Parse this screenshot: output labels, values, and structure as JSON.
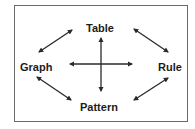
{
  "diagram": {
    "type": "relationship-diagram",
    "nodes": [
      {
        "id": "table",
        "label": "Table",
        "position": "top"
      },
      {
        "id": "graph",
        "label": "Graph",
        "position": "left"
      },
      {
        "id": "rule",
        "label": "Rule",
        "position": "right"
      },
      {
        "id": "pattern",
        "label": "Pattern",
        "position": "bottom"
      }
    ],
    "edges": [
      {
        "from": "graph",
        "to": "table",
        "style": "double-arrow"
      },
      {
        "from": "table",
        "to": "rule",
        "style": "double-arrow"
      },
      {
        "from": "graph",
        "to": "pattern",
        "style": "double-arrow"
      },
      {
        "from": "pattern",
        "to": "rule",
        "style": "double-arrow"
      },
      {
        "from": "graph",
        "to": "rule",
        "style": "double-arrow"
      },
      {
        "from": "table",
        "to": "pattern",
        "style": "double-arrow"
      }
    ],
    "colors": {
      "border": "#6a6a6a",
      "arrow": "#2a2a2a",
      "text": "#1c1c1c",
      "background": "#ffffff"
    }
  }
}
